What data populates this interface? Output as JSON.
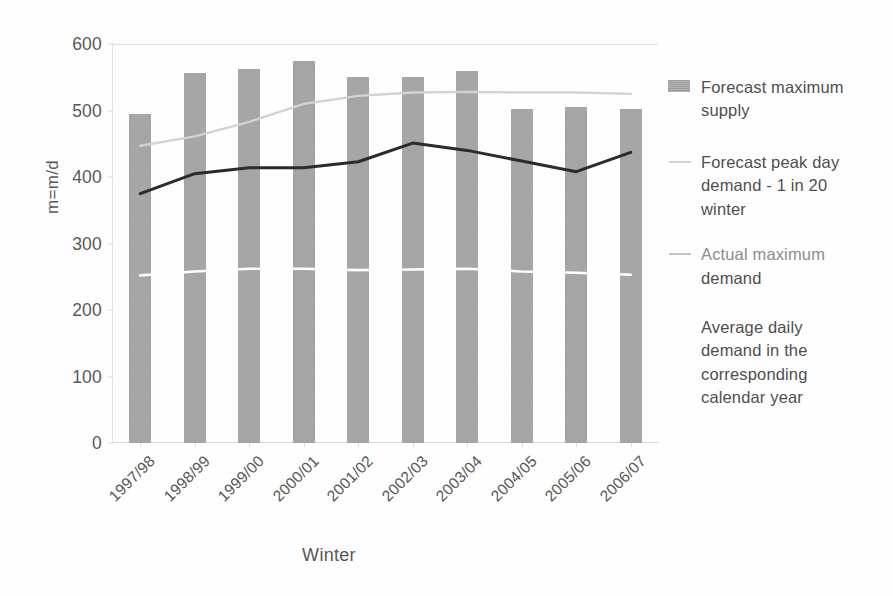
{
  "chart_data": {
    "type": "bar",
    "title": "",
    "subtitle": "",
    "xlabel": "Winter",
    "ylabel": "m=m/d",
    "categories": [
      "1997/98",
      "1998/99",
      "1999/00",
      "2000/01",
      "2001/02",
      "2002/03",
      "2003/04",
      "2004/05",
      "2005/06",
      "2006/07"
    ],
    "ylim": [
      0,
      600
    ],
    "yticks": [
      0,
      100,
      200,
      300,
      400,
      500,
      600
    ],
    "ytick_labels": [
      "0",
      "100",
      "200",
      "300",
      "400",
      "500",
      "600"
    ],
    "grid": "horizontal-top-only",
    "legend_position": "right",
    "xtick_rotation": -45,
    "series": [
      {
        "name": "Forecast maximum supply",
        "type": "bar",
        "color": "#a6a6a6",
        "values": [
          495,
          556,
          563,
          575,
          551,
          550,
          559,
          503,
          505,
          503
        ]
      },
      {
        "name": "Forecast peak day demand - 1 in 20 winter",
        "type": "line",
        "color": "#d3d3d3",
        "values": [
          447,
          461,
          483,
          510,
          522,
          527,
          528,
          527,
          527,
          525
        ]
      },
      {
        "name": "Actual maximum demand",
        "type": "line",
        "color": "#2b2b2b",
        "values": [
          375,
          405,
          414,
          414,
          423,
          451,
          440,
          424,
          408,
          437
        ]
      },
      {
        "name": "Average daily demand in the corresponding calendar year",
        "type": "line",
        "color": "#ffffff",
        "values": [
          252,
          258,
          262,
          262,
          260,
          261,
          262,
          258,
          256,
          253
        ]
      }
    ]
  },
  "axes": {
    "y_title": "m=m/d",
    "x_title": "Winter"
  },
  "legend": {
    "entries": [
      {
        "label_line1": "Forecast maximum",
        "label_line2": "supply",
        "marker": "bar-swatch-icon",
        "color": "#a6a6a6",
        "faded": false
      },
      {
        "label_line1": "Forecast peak day",
        "label_line2": "demand - 1 in 20",
        "label_line3": "winter",
        "marker": "light-line-icon",
        "color": "#d3d3d3",
        "faded": false
      },
      {
        "label_line1": "Actual maximum",
        "label_line2": "demand",
        "marker": "dark-line-icon",
        "color": "#b7b7b7",
        "faded": true
      },
      {
        "label_line1": "Average daily",
        "label_line2": "demand in the",
        "label_line3": "corresponding",
        "label_line4": "calendar year",
        "marker": "white-line-icon",
        "color": "#ffffff",
        "faded": false
      }
    ]
  }
}
